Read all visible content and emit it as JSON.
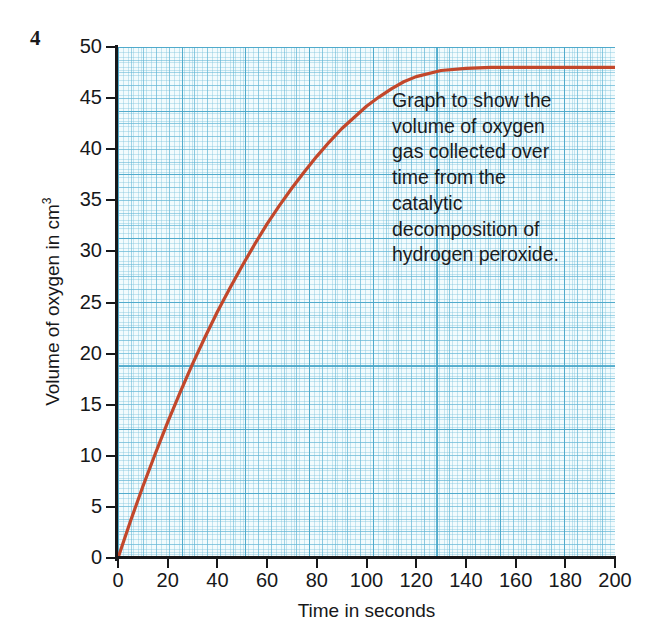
{
  "question_number": "4",
  "annotation": {
    "lines": [
      "Graph to show the",
      "volume of oxygen",
      "gas collected over",
      "time from the",
      "catalytic",
      "decomposition of",
      "hydrogen peroxide."
    ],
    "full_text": "Graph to show the volume of oxygen gas collected over time from the catalytic decomposition of hydrogen peroxide."
  },
  "colors": {
    "curve": "#c2472b",
    "grid_fine": "#7dc3dc",
    "grid_major": "#46a5c8",
    "plot_background": "#f2fbfd",
    "axis": "#17181a",
    "text": "#1b1c1e"
  },
  "chart_data": {
    "type": "line",
    "xlabel": "Time in seconds",
    "ylabel": "Volume of oxygen in cm3",
    "ylabel_display": "Volume of oxygen in cm",
    "ylabel_superscript": "3",
    "xlim": [
      0,
      200
    ],
    "ylim": [
      0,
      50
    ],
    "xticks": [
      0,
      20,
      40,
      60,
      80,
      100,
      120,
      140,
      160,
      180,
      200
    ],
    "yticks": [
      0,
      5,
      10,
      15,
      20,
      25,
      30,
      35,
      40,
      45,
      50
    ],
    "grid": true,
    "grid_style": "graph-paper",
    "legend": null,
    "series": [
      {
        "name": "Volume of oxygen collected",
        "color": "#c2472b",
        "x": [
          0,
          5,
          10,
          15,
          20,
          25,
          30,
          35,
          40,
          45,
          50,
          55,
          60,
          65,
          70,
          75,
          80,
          85,
          90,
          95,
          100,
          105,
          110,
          115,
          120,
          130,
          140,
          150,
          160,
          170,
          180,
          190,
          200
        ],
        "y": [
          0.0,
          3.6,
          7.0,
          10.2,
          13.3,
          16.2,
          19.0,
          21.6,
          24.1,
          26.4,
          28.6,
          30.7,
          32.7,
          34.5,
          36.2,
          37.8,
          39.3,
          40.7,
          42.0,
          43.1,
          44.2,
          45.1,
          45.9,
          46.6,
          47.1,
          47.7,
          47.9,
          48.0,
          48.0,
          48.0,
          48.0,
          48.0,
          48.0
        ]
      }
    ],
    "plateau_value": 48,
    "plateau_start_time": 130
  }
}
